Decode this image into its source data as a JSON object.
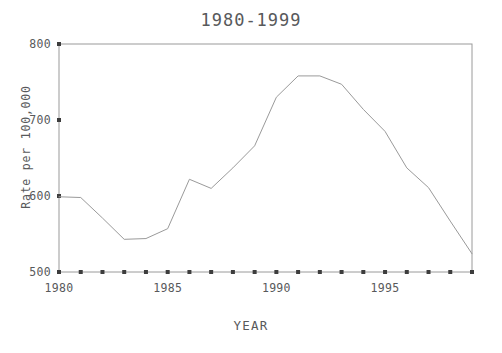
{
  "chart_data": {
    "type": "line",
    "title": "1980-1999",
    "xlabel": "YEAR",
    "ylabel": "Rate per 100,000",
    "x": [
      1980,
      1981,
      1982,
      1983,
      1984,
      1985,
      1986,
      1987,
      1988,
      1989,
      1990,
      1991,
      1992,
      1993,
      1994,
      1995,
      1996,
      1997,
      1998,
      1999
    ],
    "values": [
      599,
      598,
      571,
      543,
      544,
      557,
      622,
      610,
      637,
      666,
      730,
      758,
      758,
      747,
      714,
      685,
      637,
      611,
      567,
      524
    ],
    "series": [
      {
        "name": "Rate per 100,000",
        "values": [
          599,
          598,
          571,
          543,
          544,
          557,
          622,
          610,
          637,
          666,
          730,
          758,
          758,
          747,
          714,
          685,
          637,
          611,
          567,
          524
        ]
      }
    ],
    "xlim": [
      1980,
      1999
    ],
    "ylim": [
      500,
      800
    ],
    "yticks": [
      500,
      600,
      700,
      800
    ],
    "ytick_labels": [
      "500",
      "600",
      "700",
      "800"
    ],
    "xticks": [
      1980,
      1985,
      1990,
      1995
    ],
    "xtick_labels": [
      "1980",
      "1985",
      "1990",
      "1995"
    ],
    "xtick_minor": [
      1981,
      1982,
      1983,
      1984,
      1986,
      1987,
      1988,
      1989,
      1991,
      1992,
      1993,
      1994,
      1996,
      1997,
      1998,
      1999
    ],
    "grid": false,
    "legend": null,
    "line_color": "#9a9a9a",
    "axis_color": "#9a9a9a",
    "text_color": "#58595b",
    "background": "#ffffff"
  }
}
